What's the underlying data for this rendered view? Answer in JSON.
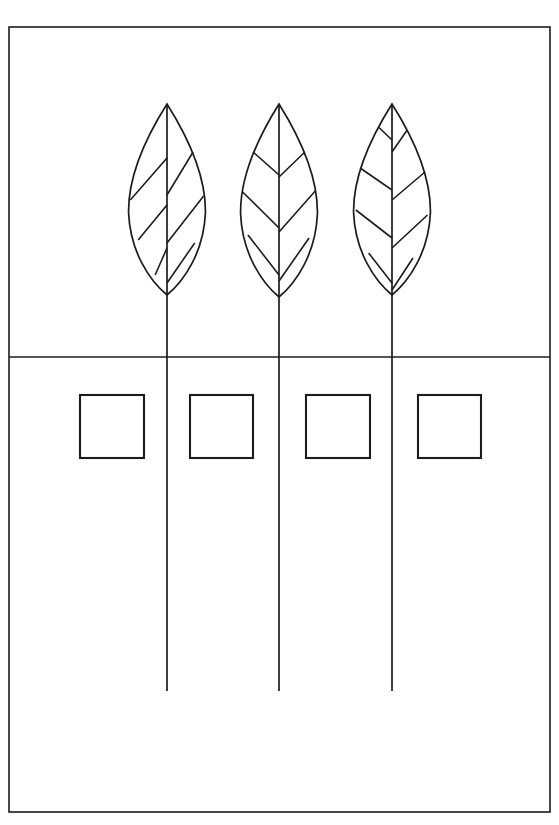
{
  "figure": {
    "kind": "line-drawing-worksheet",
    "background_color": "#ffffff",
    "ink_color": "#1c1c1c",
    "width": 559,
    "height": 825,
    "cropped_header_text": "···················"
  },
  "frame": {
    "x": 9,
    "y": 27,
    "width": 541,
    "height": 785,
    "stroke": "#1c1c1c"
  },
  "divider": {
    "label": "horizontal-divider",
    "y": 357,
    "x1": 9,
    "x2": 550,
    "stroke": "#1c1c1c"
  },
  "leaves": [
    {
      "id": "leaf-1",
      "center_x": 167,
      "tip_y": 104,
      "base_y": 295,
      "half_width": 39,
      "vein_pairs": 3,
      "veins": [
        {
          "y_rib": 158,
          "y_edge": 200
        },
        {
          "y_rib": 205,
          "y_edge": 240
        },
        {
          "y_rib": 248,
          "y_edge": 275
        }
      ],
      "veins_right": [
        {
          "y_rib": 195,
          "y_edge": 152
        },
        {
          "y_rib": 243,
          "y_edge": 196
        },
        {
          "y_rib": 283,
          "y_edge": 243
        }
      ]
    },
    {
      "id": "leaf-2",
      "center_x": 279,
      "tip_y": 104,
      "base_y": 297,
      "half_width": 39,
      "vein_pairs": 3,
      "veins": [
        {
          "y_rib": 175,
          "y_edge": 152
        },
        {
          "y_rib": 228,
          "y_edge": 192
        },
        {
          "y_rib": 275,
          "y_edge": 235
        }
      ],
      "veins_right": [
        {
          "y_rib": 177,
          "y_edge": 152
        },
        {
          "y_rib": 232,
          "y_edge": 191
        },
        {
          "y_rib": 281,
          "y_edge": 238
        }
      ]
    },
    {
      "id": "leaf-3",
      "center_x": 392,
      "tip_y": 104,
      "base_y": 295,
      "half_width": 39,
      "vein_pairs": 4,
      "veins": [
        {
          "y_rib": 140,
          "y_edge": 127
        },
        {
          "y_rib": 190,
          "y_edge": 168
        },
        {
          "y_rib": 238,
          "y_edge": 210
        },
        {
          "y_rib": 283,
          "y_edge": 253
        }
      ],
      "veins_right": [
        {
          "y_rib": 152,
          "y_edge": 130
        },
        {
          "y_rib": 200,
          "y_edge": 172
        },
        {
          "y_rib": 248,
          "y_edge": 215
        },
        {
          "y_rib": 290,
          "y_edge": 258
        }
      ]
    }
  ],
  "stems": [
    {
      "id": "stem-1",
      "x": 167,
      "y_top": 295,
      "y_bottom": 691
    },
    {
      "id": "stem-2",
      "x": 279,
      "y_top": 297,
      "y_bottom": 691
    },
    {
      "id": "stem-3",
      "x": 392,
      "y_top": 295,
      "y_bottom": 691
    }
  ],
  "answer_boxes": [
    {
      "id": "answer-box-1",
      "x": 80,
      "y": 395,
      "width": 64,
      "height": 63,
      "value": ""
    },
    {
      "id": "answer-box-2",
      "x": 190,
      "y": 395,
      "width": 63,
      "height": 63,
      "value": ""
    },
    {
      "id": "answer-box-3",
      "x": 306,
      "y": 395,
      "width": 64,
      "height": 63,
      "value": ""
    },
    {
      "id": "answer-box-4",
      "x": 418,
      "y": 395,
      "width": 63,
      "height": 63,
      "value": ""
    }
  ]
}
